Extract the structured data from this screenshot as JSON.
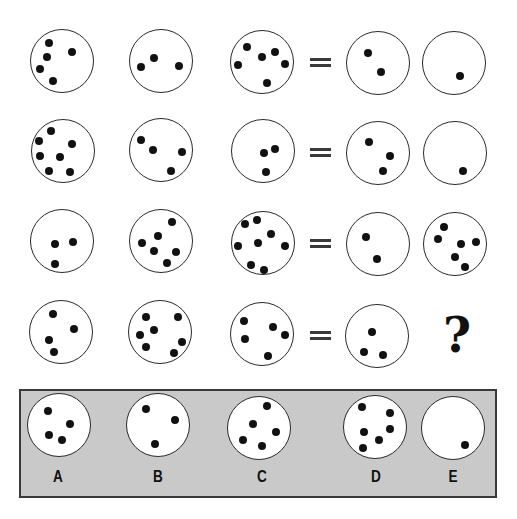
{
  "puzzle": {
    "rows": [
      {
        "equals_symbol": "=",
        "circles": [
          {
            "cx": 62,
            "cy": 61,
            "count": 5,
            "dots": [
              [
                49,
                43
              ],
              [
                72,
                52
              ],
              [
                47,
                57
              ],
              [
                40,
                69
              ],
              [
                53,
                81
              ]
            ]
          },
          {
            "cx": 161,
            "cy": 61,
            "count": 3,
            "dots": [
              [
                141,
                67
              ],
              [
                154,
                58
              ],
              [
                179,
                66
              ]
            ]
          },
          {
            "cx": 262,
            "cy": 62,
            "count": 6,
            "dots": [
              [
                247,
                47
              ],
              [
                238,
                65
              ],
              [
                262,
                57
              ],
              [
                275,
                52
              ],
              [
                285,
                64
              ],
              [
                267,
                83
              ]
            ]
          },
          {
            "cx": 378,
            "cy": 63,
            "count": 2,
            "dots": [
              [
                368,
                53
              ],
              [
                381,
                72
              ]
            ]
          },
          {
            "cx": 454,
            "cy": 63,
            "count": 1,
            "dots": [
              [
                460,
                76
              ]
            ]
          }
        ]
      },
      {
        "equals_symbol": "=",
        "circles": [
          {
            "cx": 63,
            "cy": 151,
            "count": 7,
            "dots": [
              [
                51,
                131
              ],
              [
                39,
                141
              ],
              [
                72,
                144
              ],
              [
                40,
                156
              ],
              [
                60,
                157
              ],
              [
                49,
                171
              ],
              [
                70,
                172
              ]
            ]
          },
          {
            "cx": 161,
            "cy": 150,
            "count": 4,
            "dots": [
              [
                141,
                140
              ],
              [
                153,
                150
              ],
              [
                182,
                152
              ],
              [
                171,
                171
              ]
            ]
          },
          {
            "cx": 263,
            "cy": 151,
            "count": 3,
            "dots": [
              [
                264,
                153
              ],
              [
                275,
                149
              ],
              [
                266,
                172
              ]
            ]
          },
          {
            "cx": 378,
            "cy": 153,
            "count": 3,
            "dots": [
              [
                369,
                142
              ],
              [
                390,
                156
              ],
              [
                383,
                171
              ]
            ]
          },
          {
            "cx": 455,
            "cy": 153,
            "count": 1,
            "dots": [
              [
                463,
                171
              ]
            ]
          }
        ]
      },
      {
        "equals_symbol": "=",
        "circles": [
          {
            "cx": 62,
            "cy": 241,
            "count": 3,
            "dots": [
              [
                55,
                244
              ],
              [
                73,
                242
              ],
              [
                55,
                264
              ]
            ]
          },
          {
            "cx": 161,
            "cy": 241,
            "count": 6,
            "dots": [
              [
                172,
                222
              ],
              [
                158,
                236
              ],
              [
                142,
                243
              ],
              [
                154,
                251
              ],
              [
                176,
                252
              ],
              [
                167,
                263
              ]
            ]
          },
          {
            "cx": 263,
            "cy": 243,
            "count": 8,
            "dots": [
              [
                245,
                224
              ],
              [
                257,
                220
              ],
              [
                271,
                234
              ],
              [
                238,
                246
              ],
              [
                258,
                243
              ],
              [
                285,
                246
              ],
              [
                251,
                265
              ],
              [
                264,
                270
              ]
            ]
          },
          {
            "cx": 378,
            "cy": 244,
            "count": 2,
            "dots": [
              [
                366,
                237
              ],
              [
                377,
                259
              ]
            ]
          },
          {
            "cx": 455,
            "cy": 244,
            "count": 6,
            "dots": [
              [
                444,
                227
              ],
              [
                438,
                239
              ],
              [
                461,
                244
              ],
              [
                476,
                242
              ],
              [
                455,
                257
              ],
              [
                465,
                267
              ]
            ]
          }
        ]
      },
      {
        "equals_symbol": "=",
        "circles": [
          {
            "cx": 61,
            "cy": 332,
            "count": 4,
            "dots": [
              [
                53,
                314
              ],
              [
                74,
                329
              ],
              [
                49,
                340
              ],
              [
                54,
                352
              ]
            ]
          },
          {
            "cx": 160,
            "cy": 332,
            "count": 7,
            "dots": [
              [
                146,
                317
              ],
              [
                178,
                317
              ],
              [
                154,
                330
              ],
              [
                140,
                335
              ],
              [
                182,
                342
              ],
              [
                146,
                347
              ],
              [
                174,
                353
              ]
            ]
          },
          {
            "cx": 262,
            "cy": 334,
            "count": 5,
            "dots": [
              [
                244,
                321
              ],
              [
                273,
                327
              ],
              [
                285,
                335
              ],
              [
                245,
                339
              ],
              [
                268,
                356
              ]
            ]
          },
          {
            "cx": 377,
            "cy": 336,
            "count": 3,
            "dots": [
              [
                372,
                332
              ],
              [
                364,
                352
              ],
              [
                383,
                355
              ]
            ]
          }
        ],
        "unknown": {
          "symbol": "?",
          "x": 457,
          "y": 335
        }
      }
    ],
    "equals_positions": [
      {
        "x": 310,
        "y": 58
      },
      {
        "x": 310,
        "y": 148
      },
      {
        "x": 310,
        "y": 239
      },
      {
        "x": 310,
        "y": 331
      }
    ]
  },
  "options": [
    {
      "label": "A",
      "cx": 59,
      "cy": 425,
      "count": 4,
      "dots": [
        [
          48,
          411
        ],
        [
          70,
          424
        ],
        [
          49,
          435
        ],
        [
          62,
          440
        ]
      ],
      "label_x": 58,
      "label_y": 477
    },
    {
      "label": "B",
      "cx": 158,
      "cy": 425,
      "count": 3,
      "dots": [
        [
          146,
          409
        ],
        [
          175,
          420
        ],
        [
          155,
          444
        ]
      ],
      "label_x": 158,
      "label_y": 477
    },
    {
      "label": "C",
      "cx": 259,
      "cy": 428,
      "count": 5,
      "dots": [
        [
          267,
          406
        ],
        [
          253,
          424
        ],
        [
          276,
          432
        ],
        [
          243,
          440
        ],
        [
          262,
          446
        ]
      ],
      "label_x": 262,
      "label_y": 477
    },
    {
      "label": "D",
      "cx": 375,
      "cy": 427,
      "count": 6,
      "dots": [
        [
          362,
          407
        ],
        [
          390,
          413
        ],
        [
          364,
          432
        ],
        [
          390,
          429
        ],
        [
          379,
          440
        ],
        [
          363,
          448
        ]
      ],
      "label_x": 376,
      "label_y": 477
    },
    {
      "label": "E",
      "cx": 453,
      "cy": 428,
      "count": 1,
      "dots": [
        [
          465,
          445
        ]
      ],
      "label_x": 453,
      "label_y": 477
    }
  ],
  "colors": {
    "answer_box_fill": "#c9c9c9",
    "dot": "#111111",
    "circle_stroke": "#2a2a2a"
  }
}
